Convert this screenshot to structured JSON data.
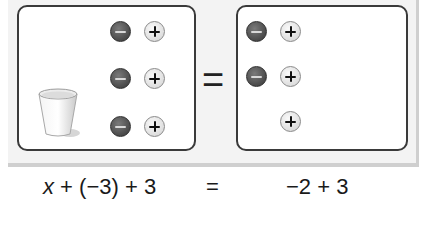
{
  "diagram": {
    "type": "algebra-tiles-equation-mat",
    "left_side": {
      "cup": {
        "label": "x",
        "icon": "cup-icon"
      },
      "rows": [
        {
          "negative": 1,
          "positive": 1
        },
        {
          "negative": 1,
          "positive": 1
        },
        {
          "negative": 1,
          "positive": 1
        }
      ]
    },
    "equals_symbol": "=",
    "right_side": {
      "rows": [
        {
          "negative": 1,
          "positive": 1
        },
        {
          "negative": 1,
          "positive": 1
        },
        {
          "negative": 0,
          "positive": 1
        }
      ]
    },
    "counter_symbols": {
      "negative": "−",
      "positive": "+"
    },
    "colors": {
      "negative_counter": "#4a4a4a",
      "positive_counter": "#e0e0e0",
      "mat_border": "#3a3a3a",
      "panel_bg": "#f3f3f3"
    }
  },
  "equation": {
    "lhs_var": "x",
    "lhs_rest": " + (−3) + 3",
    "equals": "=",
    "rhs": "−2 + 3"
  }
}
